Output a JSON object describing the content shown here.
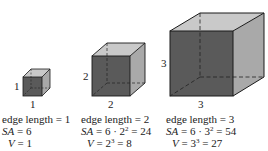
{
  "cubes": [
    {
      "edge": 1,
      "side_label": "1",
      "bottom_label": "1",
      "line1": "edge length = 1",
      "sa_label": "SA",
      "sa_expr": " = 6",
      "v_label": "V",
      "v_expr": " = 1"
    },
    {
      "edge": 2,
      "side_label": "2",
      "bottom_label": "2",
      "line1": "edge length = 2",
      "sa_label": "SA",
      "sa_pre": " = 6 · 2",
      "sa_exp": "2",
      "sa_post": " = 24",
      "v_label": "V",
      "v_pre": " = 2",
      "v_exp": "3",
      "v_post": " = 8"
    },
    {
      "edge": 3,
      "side_label": "3",
      "bottom_label": "3",
      "line1": "edge length = 3",
      "sa_label": "SA",
      "sa_pre": " = 6 · 3",
      "sa_exp": "2",
      "sa_post": " = 54",
      "v_label": "V",
      "v_pre": " = 3",
      "v_exp": "3",
      "v_post": " = 27"
    }
  ],
  "colors": {
    "front_face": "#5a5a5a",
    "side_face": "#a9a9a9",
    "top_face": "#c9c9c9",
    "edge": "#1a1a1a"
  }
}
